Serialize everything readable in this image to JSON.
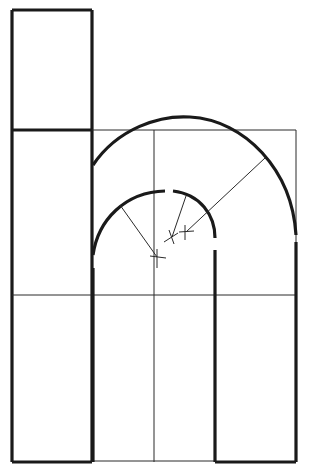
{
  "diagram": {
    "colors": {
      "ink": "#1a1a1a",
      "construction": "#2a2a2a",
      "paper": "#ffffff"
    },
    "centers": [
      {
        "name": "inner-arc-center",
        "x": 157,
        "y": 257
      },
      {
        "name": "shoulder-center",
        "x": 172,
        "y": 237
      },
      {
        "name": "outer-arc-center",
        "x": 186,
        "y": 232
      }
    ],
    "guide_lines": {
      "x_height": 130,
      "mid_line": 295,
      "center_vertical": 154,
      "right_edge": 296
    }
  }
}
